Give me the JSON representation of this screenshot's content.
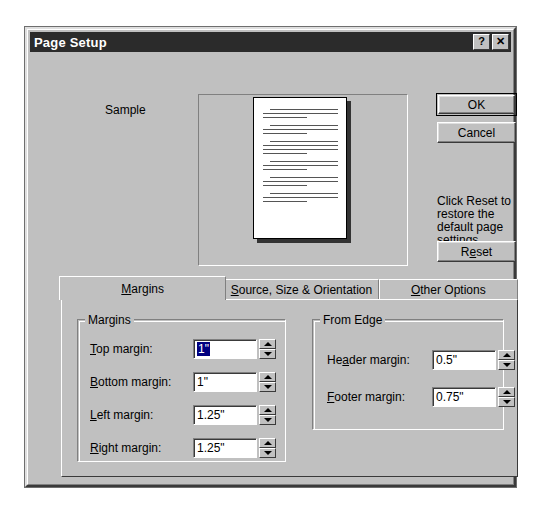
{
  "window": {
    "title": "Page Setup",
    "help_button": "?",
    "close_button": "✕"
  },
  "sample": {
    "label": "Sample"
  },
  "buttons": {
    "ok": "OK",
    "cancel": "Cancel",
    "reset": "Reset",
    "reset_accel": "e",
    "reset_help_text": "Click Reset to restore the default page settings."
  },
  "tabs": [
    {
      "label": "Margins",
      "accel": "M",
      "active": true
    },
    {
      "label": "Source, Size & Orientation",
      "accel": "S",
      "active": false
    },
    {
      "label": "Other Options",
      "accel": "O",
      "active": false
    }
  ],
  "groups": {
    "margins": {
      "legend": "Margins",
      "fields": [
        {
          "label": "Top margin:",
          "accel": "T",
          "value": "1\"",
          "selected": true
        },
        {
          "label": "Bottom margin:",
          "accel": "B",
          "value": "1\"",
          "selected": false
        },
        {
          "label": "Left margin:",
          "accel": "L",
          "value": "1.25\"",
          "selected": false
        },
        {
          "label": "Right margin:",
          "accel": "R",
          "value": "1.25\"",
          "selected": false
        }
      ]
    },
    "from_edge": {
      "legend": "From Edge",
      "fields": [
        {
          "label": "Header margin:",
          "accel": "a",
          "value": "0.5\"",
          "selected": false
        },
        {
          "label": "Footer margin:",
          "accel": "F",
          "value": "0.75\"",
          "selected": false
        }
      ]
    }
  },
  "colors": {
    "face": "#c0c0c0",
    "titlebar": "#2b2b2b",
    "titlebar_text": "#ffffff",
    "selection": "#000080",
    "shadow": "#808080",
    "highlight": "#ffffff",
    "text": "#000000",
    "page_white": "#ffffff"
  },
  "preview": {
    "lines": [
      "indent",
      "full",
      "short",
      "gap",
      "indent",
      "full",
      "short",
      "gap",
      "indent",
      "full",
      "full",
      "short",
      "gap",
      "indent",
      "full",
      "short",
      "gap",
      "indent",
      "full",
      "short",
      "gap",
      "indent",
      "full",
      "short"
    ]
  }
}
